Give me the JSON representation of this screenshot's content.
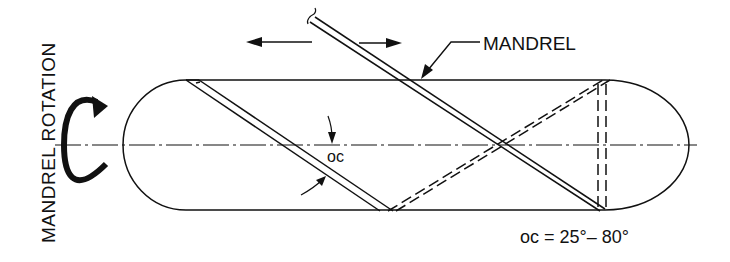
{
  "diagram": {
    "title_vertical": "MANDREL ROTATION",
    "mandrel_label": "MANDREL",
    "angle_label": "oc",
    "angle_range": "oc = 25°– 80°",
    "colors": {
      "line": "#111111",
      "background": "#ffffff"
    }
  }
}
